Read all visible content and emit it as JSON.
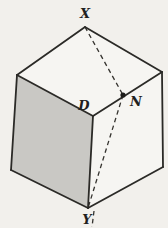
{
  "figure": {
    "colors": {
      "background": "#f2f0ec",
      "white_face": "#f6f5f2",
      "shaded_face": "#c9c8c4",
      "edge_stroke": "#2b2a27",
      "dash_stroke": "#35332f",
      "label_color": "#21201d",
      "point_fill": "#1d1c1a"
    },
    "vertices": {
      "top": [
        85,
        27
      ],
      "left": [
        17,
        75
      ],
      "right": [
        162,
        72
      ],
      "front": [
        93,
        116
      ],
      "bottomLeft": [
        11,
        170
      ],
      "bottomRight": [
        163,
        167
      ],
      "bottomFront": [
        88,
        208
      ]
    },
    "point_n": [
      123,
      95
    ],
    "point_n_radius": 2.6,
    "shaded_face_vertices": [
      "left",
      "front",
      "bottomFront",
      "bottomLeft"
    ],
    "top_face_vertices": [
      "top",
      "left",
      "front",
      "right"
    ],
    "right_face_vertices": [
      "front",
      "right",
      "bottomRight",
      "bottomFront"
    ],
    "solid_edges": [
      [
        "top",
        "left"
      ],
      [
        "top",
        "right"
      ],
      [
        "left",
        "front"
      ],
      [
        "front",
        "right"
      ],
      [
        "left",
        "bottomLeft"
      ],
      [
        "bottomLeft",
        "bottomFront"
      ],
      [
        "front",
        "bottomFront"
      ],
      [
        "right",
        "bottomRight"
      ],
      [
        "bottomRight",
        "bottomFront"
      ]
    ],
    "dashed_segments": [
      {
        "name": "dashed-line-x-to-n",
        "from": [
          85,
          27
        ],
        "to": [
          123,
          95
        ]
      },
      {
        "name": "dashed-line-n-to-y",
        "from": [
          123,
          95
        ],
        "to": [
          88,
          208
        ]
      },
      {
        "name": "dashed-stub-below-y",
        "from": [
          94,
          211
        ],
        "to": [
          92,
          227
        ]
      }
    ],
    "labels": [
      {
        "name": "label-x",
        "text": "X",
        "x": 85,
        "y": 18,
        "size": 13
      },
      {
        "name": "label-d",
        "text": "D",
        "x": 84,
        "y": 110,
        "size": 13
      },
      {
        "name": "label-n",
        "text": "N",
        "x": 136,
        "y": 106,
        "size": 13
      },
      {
        "name": "label-y",
        "text": "Y",
        "x": 87,
        "y": 224,
        "size": 13
      }
    ],
    "stroke_widths": {
      "edge": 1.8,
      "dash": 1.3
    },
    "dash_array": "4.5 3.5"
  }
}
